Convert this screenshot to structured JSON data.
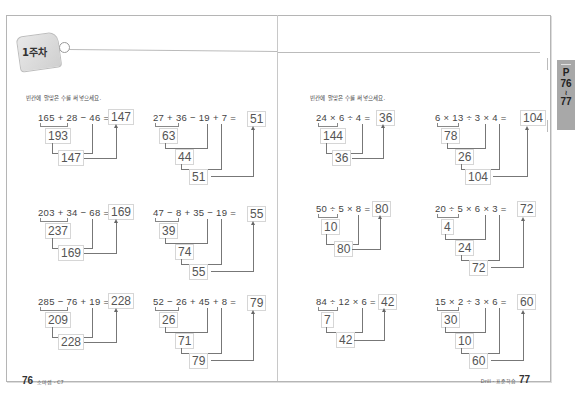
{
  "header": {
    "week_label": "1주차"
  },
  "left_page": {
    "instruction": "빈칸에 알맞은 수를 써넣으세요.",
    "page_number": "76",
    "footer_text": "소마셈 - C7",
    "problems": [
      {
        "expression": "165 + 28 − 46 =",
        "answer": "147",
        "steps": [
          "193",
          "147"
        ]
      },
      {
        "expression": "27 + 36 − 19 + 7 =",
        "answer": "51",
        "steps": [
          "63",
          "44",
          "51"
        ]
      },
      {
        "expression": "203 + 34 − 68 =",
        "answer": "169",
        "steps": [
          "237",
          "169"
        ]
      },
      {
        "expression": "47 − 8 + 35 − 19 =",
        "answer": "55",
        "steps": [
          "39",
          "74",
          "55"
        ]
      },
      {
        "expression": "285 − 76 + 19 =",
        "answer": "228",
        "steps": [
          "209",
          "228"
        ]
      },
      {
        "expression": "52 − 26 + 45 + 8 =",
        "answer": "79",
        "steps": [
          "26",
          "71",
          "79"
        ]
      }
    ]
  },
  "right_page": {
    "instruction": "빈칸에 알맞은 수를 써넣으세요.",
    "page_number": "77",
    "footer_text": "Drill - 표준학습",
    "problems": [
      {
        "expression": "24 × 6 ÷ 4 =",
        "answer": "36",
        "steps": [
          "144",
          "36"
        ]
      },
      {
        "expression": "6 × 13 ÷ 3 × 4 =",
        "answer": "104",
        "steps": [
          "78",
          "26",
          "104"
        ]
      },
      {
        "expression": "50 ÷ 5 × 8 =",
        "answer": "80",
        "steps": [
          "10",
          "80"
        ]
      },
      {
        "expression": "20 ÷ 5 × 6 × 3 =",
        "answer": "72",
        "steps": [
          "4",
          "24",
          "72"
        ]
      },
      {
        "expression": "84 ÷ 12 × 6 =",
        "answer": "42",
        "steps": [
          "7",
          "42"
        ]
      },
      {
        "expression": "15 × 2 ÷ 3 × 6 =",
        "answer": "60",
        "steps": [
          "30",
          "10",
          "60"
        ]
      }
    ]
  },
  "side_tab": {
    "prefix": "P",
    "start": "76",
    "sep": "≀",
    "end": "77"
  }
}
